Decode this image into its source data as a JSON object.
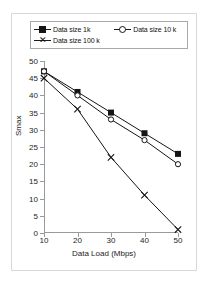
{
  "chart_data": {
    "type": "line",
    "title": "",
    "xlabel": "Data Load (Mbps)",
    "ylabel": "Smax",
    "x": [
      10,
      20,
      30,
      40,
      50
    ],
    "xlim": [
      10,
      50
    ],
    "ylim": [
      0,
      50
    ],
    "xticks": [
      "10",
      "20",
      "30",
      "40",
      "50"
    ],
    "yticks": [
      "0",
      "5",
      "10",
      "15",
      "20",
      "25",
      "30",
      "35",
      "40",
      "45",
      "50"
    ],
    "grid": false,
    "legend_position": "top",
    "series": [
      {
        "name": "Data size 1k",
        "marker": "filled-square",
        "color": "#151515",
        "values": [
          47,
          41,
          35,
          29,
          23
        ]
      },
      {
        "name": "Data size 10 k",
        "marker": "open-circle",
        "color": "#151515",
        "values": [
          47,
          40,
          33,
          27,
          20
        ]
      },
      {
        "name": "Data size 100 k",
        "marker": "x-cross",
        "color": "#151515",
        "values": [
          45,
          36,
          22,
          11,
          1
        ]
      }
    ]
  }
}
